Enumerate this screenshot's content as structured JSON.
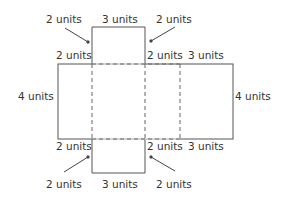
{
  "diagram": {
    "type": "net-of-rectangular-prism",
    "colors": {
      "line": "#555555",
      "text": "#333333",
      "background": "#ffffff"
    },
    "labels": {
      "top_left_arrow": "2 units",
      "top_flap_width": "3 units",
      "top_right_arrow": "2 units",
      "upper_left_edge": "2 units",
      "upper_mid_edge": "2 units",
      "upper_right_edge": "3 units",
      "left_height": "4 units",
      "right_height": "4 units",
      "lower_left_edge": "2 units",
      "lower_mid_edge": "2 units",
      "lower_right_edge": "3 units",
      "bottom_left_arrow": "2 units",
      "bottom_flap_width": "3 units",
      "bottom_right_arrow": "2 units"
    }
  }
}
